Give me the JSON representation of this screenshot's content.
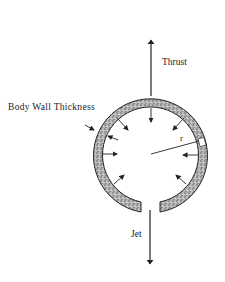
{
  "diagram": {
    "labels": {
      "thrust": "Thrust",
      "body_wall": "Body Wall Thickness",
      "jet": "Jet",
      "radius": "r"
    },
    "elements": {
      "body_ring": "stippled circular body wall with gap at bottom",
      "inward_arrows": 8,
      "thrust_arrow_direction": "up",
      "jet_arrow_direction": "down"
    },
    "colors": {
      "ink": "#222222",
      "wall_fill": "#9a9a9a",
      "background": "#ffffff"
    }
  }
}
